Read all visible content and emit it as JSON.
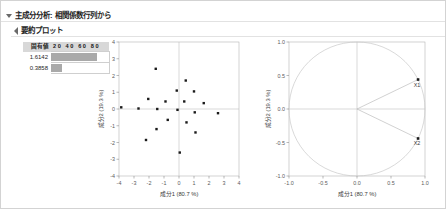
{
  "outline": {
    "level1": {
      "label": "主成分分析: 相関係数行列から",
      "icon": "triangle-down-icon"
    },
    "level2": {
      "label": "要約プロット",
      "icon": "triangle-right-icon"
    }
  },
  "eigen_table": {
    "headers": [
      "固有値",
      "20  40  60  80"
    ],
    "scale_ticks": [
      "20",
      "40",
      "60",
      "80"
    ],
    "rows": [
      {
        "value": "1.6142",
        "bar_percent": 80.7
      },
      {
        "value": "0.3858",
        "bar_percent": 19.3
      }
    ]
  },
  "chart_data": [
    {
      "type": "scatter",
      "name": "score-plot",
      "title": "",
      "xlabel": "成分1  (80.7 %)",
      "ylabel": "成分2  (19.3 %)",
      "xlim": [
        -4,
        4
      ],
      "ylim": [
        -4,
        4
      ],
      "xticks": [
        "-4",
        "-3",
        "-2",
        "-1",
        "0",
        "1",
        "2",
        "3",
        "4"
      ],
      "yticks": [
        "4",
        "3",
        "2",
        "1",
        "0",
        "-1",
        "-2",
        "-3",
        "-4"
      ],
      "grid": false,
      "zero_lines": true,
      "points": [
        [
          -3.85,
          0.1
        ],
        [
          -2.7,
          0.03
        ],
        [
          -2.2,
          -1.85
        ],
        [
          -2.05,
          0.6
        ],
        [
          -1.55,
          2.4
        ],
        [
          -1.5,
          -1.2
        ],
        [
          -1.45,
          0.0
        ],
        [
          -0.9,
          0.45
        ],
        [
          -0.75,
          -0.65
        ],
        [
          -0.15,
          1.1
        ],
        [
          -0.1,
          -0.05
        ],
        [
          0.05,
          -2.6
        ],
        [
          0.35,
          0.45
        ],
        [
          0.45,
          1.7
        ],
        [
          0.5,
          -0.8
        ],
        [
          1.0,
          1.05
        ],
        [
          1.05,
          -0.2
        ],
        [
          1.1,
          -1.4
        ],
        [
          1.65,
          0.35
        ],
        [
          2.6,
          -0.25
        ]
      ]
    },
    {
      "type": "scatter",
      "name": "loading-plot",
      "title": "",
      "xlabel": "成分1  (80.7 %)",
      "ylabel": "成分2  (19.3 %)",
      "xlim": [
        -1.0,
        1.0
      ],
      "ylim": [
        -1.0,
        1.0
      ],
      "xticks": [
        "-1.0",
        "-0.5",
        "0.0",
        "0.5",
        "1.0"
      ],
      "yticks": [
        "1.0",
        "0.5",
        "0.0",
        "-0.5",
        "-1.0"
      ],
      "unit_circle": true,
      "grid": false,
      "zero_lines": true,
      "vectors": [
        {
          "label": "X1",
          "x": 0.898,
          "y": 0.44
        },
        {
          "label": "X2",
          "x": 0.898,
          "y": -0.44
        }
      ]
    }
  ]
}
